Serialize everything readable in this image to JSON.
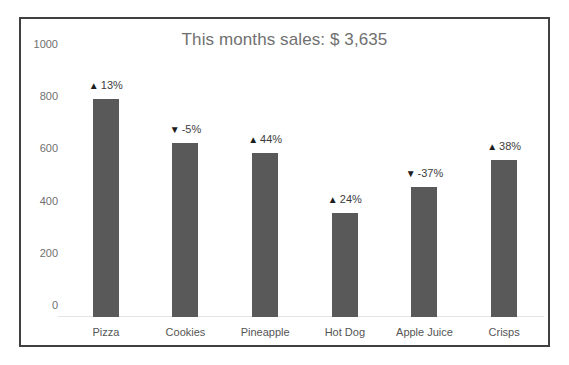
{
  "chart_data": {
    "type": "bar",
    "title": "This months sales: $ 3,635",
    "xlabel": "",
    "ylabel": "",
    "ylim": [
      0,
      1000
    ],
    "yticks": [
      0,
      200,
      400,
      600,
      800,
      1000
    ],
    "ytick_labels": [
      "0",
      "200",
      "400",
      "600",
      "800",
      "1000"
    ],
    "grid": false,
    "legend": "none",
    "categories": [
      "Pizza",
      "Cookies",
      "Pineapple",
      "Hot Dog",
      "Apple Juice",
      "Crisps"
    ],
    "values": [
      835,
      665,
      630,
      400,
      500,
      600
    ],
    "bar_color": "#595959",
    "series": [
      {
        "name": "Sales",
        "values": [
          835,
          665,
          630,
          400,
          500,
          600
        ]
      }
    ],
    "annotations": [
      {
        "category": "Pizza",
        "direction": "up",
        "arrow": "▲",
        "label": "13%"
      },
      {
        "category": "Cookies",
        "direction": "down",
        "arrow": "▼",
        "label": "-5%"
      },
      {
        "category": "Pineapple",
        "direction": "up",
        "arrow": "▲",
        "label": "44%"
      },
      {
        "category": "Hot Dog",
        "direction": "up",
        "arrow": "▲",
        "label": "24%"
      },
      {
        "category": "Apple Juice",
        "direction": "down",
        "arrow": "▼",
        "label": "-37%"
      },
      {
        "category": "Crisps",
        "direction": "up",
        "arrow": "▲",
        "label": "38%"
      }
    ]
  },
  "style": {
    "frame_border_color": "#404040",
    "title_color": "#707070",
    "tick_color": "#6f6f6f",
    "baseline_color": "#e4e4e4",
    "background": "#ffffff"
  }
}
